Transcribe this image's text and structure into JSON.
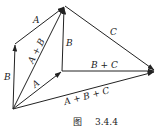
{
  "figure": {
    "caption_prefix": "图",
    "caption_number": "3.4.4"
  },
  "points": {
    "O": [
      13,
      109
    ],
    "P": [
      15,
      44
    ],
    "T": [
      65,
      6
    ],
    "M": [
      62,
      71
    ],
    "R": [
      155,
      71
    ]
  },
  "vectors": [
    {
      "name": "B-left",
      "from": "O",
      "to": "P",
      "label": "B"
    },
    {
      "name": "A-top",
      "from": "P",
      "to": "T",
      "label": "A"
    },
    {
      "name": "A-plus-B",
      "from": "O",
      "to": "T",
      "label": "A + B"
    },
    {
      "name": "A-lower",
      "from": "O",
      "to": "M",
      "label": "A"
    },
    {
      "name": "B-middle",
      "from": "M",
      "to": "T",
      "label": "B"
    },
    {
      "name": "C",
      "from": "T",
      "to": "R",
      "label": "C"
    },
    {
      "name": "B-plus-C",
      "from": "M",
      "to": "R",
      "label": "B + C"
    },
    {
      "name": "A-plus-B-plus-C",
      "from": "O",
      "to": "R",
      "label": "A + B + C"
    }
  ],
  "labels": {
    "B_left": "B",
    "A_top": "A",
    "A_plus_B": "A + B",
    "A_lower": "A",
    "B_middle": "B",
    "C": "C",
    "B_plus_C": "B + C",
    "A_plus_B_plus_C": "A + B + C"
  },
  "colors": {
    "stroke": "#222222",
    "background": "#ffffff"
  }
}
